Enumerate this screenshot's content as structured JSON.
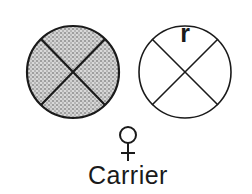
{
  "diagram": {
    "chromosomes": [
      {
        "id": "left",
        "fill": "stippled",
        "allele_label": ""
      },
      {
        "id": "right",
        "fill": "none",
        "allele_label": "r"
      }
    ],
    "sex_symbol": "♀",
    "caption": "Carrier",
    "colors": {
      "stroke": "#1a1a1a",
      "stipple": "#9a9a9a",
      "background": "#ffffff"
    }
  }
}
